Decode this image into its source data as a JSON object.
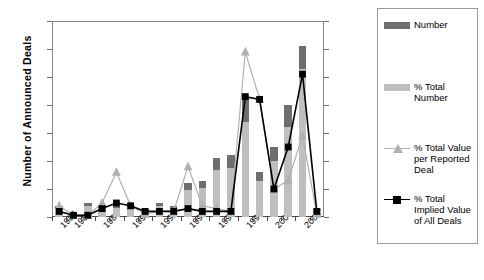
{
  "axes": {
    "left_title": "Number of Announced Deals",
    "right_title": "Percent of 1985-2002 Total",
    "left_ticks": [
      "0",
      "10",
      "20",
      "30",
      "40",
      "50",
      "60",
      "70"
    ],
    "right_ticks": [
      "0%",
      "5%",
      "10%",
      "15%",
      "20%",
      "25%",
      "30%",
      "35%"
    ]
  },
  "legend": {
    "items": [
      {
        "label": "Number",
        "type": "bar",
        "color": "#6e6e6e"
      },
      {
        "label": "% Total Number",
        "type": "bar",
        "color": "#bfbfbf"
      },
      {
        "label": "% Total Value per Reported Deal",
        "type": "line-triangle",
        "color": "#b0b0b0"
      },
      {
        "label": "% Total Implied Value of All Deals",
        "type": "line-square",
        "color": "#000000"
      }
    ]
  },
  "chart_data": {
    "type": "bar",
    "title": "",
    "xlabel": "",
    "ylabel": "Number of Announced Deals",
    "y2label": "Percent of 1985-2002 Total",
    "ylim": [
      0,
      70
    ],
    "y2lim": [
      0,
      35
    ],
    "grid": false,
    "legend_position": "right",
    "categories": [
      "1985",
      "1986",
      "1987",
      "1988",
      "1989",
      "1990",
      "1991",
      "1992",
      "1993",
      "1994",
      "1995",
      "1996",
      "1997",
      "1998",
      "1999",
      "2000",
      "2001",
      "2002",
      "2003"
    ],
    "tick_labels": [
      "1985",
      "1986",
      "",
      "1988",
      "",
      "1990",
      "",
      "1992",
      "",
      "1994",
      "",
      "1996",
      "",
      "1998",
      "",
      "2000",
      "",
      "2002",
      ""
    ],
    "series": [
      {
        "name": "Number",
        "axis": "left",
        "type": "bar",
        "color": "#6e6e6e",
        "values": [
          4,
          1,
          5,
          4,
          4,
          5,
          3,
          5,
          4,
          12,
          13,
          21,
          22,
          43,
          16,
          25,
          40,
          61,
          3
        ]
      },
      {
        "name": "% Total Number",
        "axis": "right",
        "type": "bar",
        "color": "#bfbfbf",
        "values": [
          1.5,
          0.4,
          2.0,
          1.6,
          1.6,
          2.0,
          1.2,
          2.0,
          1.6,
          4.8,
          5.2,
          8.4,
          8.8,
          17.0,
          6.4,
          10.0,
          16.0,
          26.5,
          1.2
        ]
      },
      {
        "name": "% Total Value per Reported Deal",
        "axis": "right",
        "type": "line",
        "marker": "triangle",
        "color": "#b0b0b0",
        "values": [
          2.0,
          0.3,
          0.3,
          2.5,
          8.0,
          2.0,
          0.5,
          1.0,
          1.0,
          9.0,
          2.0,
          1.5,
          1.0,
          29.5,
          21.0,
          5.0,
          6.5,
          14.5,
          0.5
        ]
      },
      {
        "name": "% Total Implied Value of All Deals",
        "axis": "right",
        "type": "line",
        "marker": "square",
        "color": "#000000",
        "values": [
          1.0,
          0.3,
          0.3,
          1.5,
          2.5,
          2.0,
          1.0,
          1.0,
          1.0,
          1.5,
          1.0,
          1.0,
          1.0,
          21.5,
          21.0,
          5.0,
          12.5,
          25.5,
          1.0
        ]
      }
    ]
  }
}
